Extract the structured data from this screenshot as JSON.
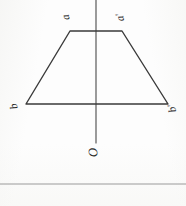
{
  "diagram": {
    "background_color": "#fdfdfd",
    "stroke_color": "#3a3a3a",
    "labels": {
      "top_left": "a",
      "top_right": "a'",
      "bottom_left": "b",
      "bottom_right": "b'",
      "origin": "O"
    },
    "shapes": {
      "trapezoid": {
        "name": "trapezoid",
        "points": "70,31 122,31 168,104 26,104",
        "stroke": "#3a3a3a",
        "stroke_width": "1.4"
      },
      "axis": {
        "name": "vertical-axis-of-symmetry",
        "x1": "96",
        "y1": "0",
        "x2": "96",
        "y2": "143",
        "stroke": "#4a4a4a",
        "stroke_width": "1.1"
      },
      "baseline_rule": {
        "name": "horizontal-rule",
        "x1": "0",
        "y1": "184",
        "x2": "186",
        "y2": "184",
        "stroke": "#9a9a9a",
        "stroke_width": "1"
      }
    }
  }
}
